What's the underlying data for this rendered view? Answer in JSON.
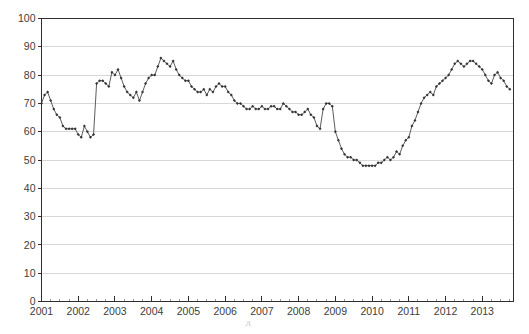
{
  "chart_data": {
    "type": "line",
    "title": "",
    "xlabel": "",
    "ylabel": "",
    "ylim": [
      0,
      100
    ],
    "xlim": [
      2001.0,
      2013.85
    ],
    "grid": "horizontal",
    "legend": "none",
    "y_ticks": [
      0,
      10,
      20,
      30,
      40,
      50,
      60,
      70,
      80,
      90,
      100
    ],
    "x_ticks": [
      2001,
      2002,
      2003,
      2004,
      2005,
      2006,
      2007,
      2008,
      2009,
      2010,
      2011,
      2012,
      2013
    ],
    "marker": "diamond",
    "series": [
      {
        "name": "index",
        "x": [
          2001.0,
          2001.083,
          2001.167,
          2001.25,
          2001.333,
          2001.417,
          2001.5,
          2001.583,
          2001.667,
          2001.75,
          2001.833,
          2001.917,
          2002.0,
          2002.083,
          2002.167,
          2002.25,
          2002.333,
          2002.417,
          2002.5,
          2002.583,
          2002.667,
          2002.75,
          2002.833,
          2002.917,
          2003.0,
          2003.083,
          2003.167,
          2003.25,
          2003.333,
          2003.417,
          2003.5,
          2003.583,
          2003.667,
          2003.75,
          2003.833,
          2003.917,
          2004.0,
          2004.083,
          2004.167,
          2004.25,
          2004.333,
          2004.417,
          2004.5,
          2004.583,
          2004.667,
          2004.75,
          2004.833,
          2004.917,
          2005.0,
          2005.083,
          2005.167,
          2005.25,
          2005.333,
          2005.417,
          2005.5,
          2005.583,
          2005.667,
          2005.75,
          2005.833,
          2005.917,
          2006.0,
          2006.083,
          2006.167,
          2006.25,
          2006.333,
          2006.417,
          2006.5,
          2006.583,
          2006.667,
          2006.75,
          2006.833,
          2006.917,
          2007.0,
          2007.083,
          2007.167,
          2007.25,
          2007.333,
          2007.417,
          2007.5,
          2007.583,
          2007.667,
          2007.75,
          2007.833,
          2007.917,
          2008.0,
          2008.083,
          2008.167,
          2008.25,
          2008.333,
          2008.417,
          2008.5,
          2008.583,
          2008.667,
          2008.75,
          2008.833,
          2008.917,
          2009.0,
          2009.083,
          2009.167,
          2009.25,
          2009.333,
          2009.417,
          2009.5,
          2009.583,
          2009.667,
          2009.75,
          2009.833,
          2009.917,
          2010.0,
          2010.083,
          2010.167,
          2010.25,
          2010.333,
          2010.417,
          2010.5,
          2010.583,
          2010.667,
          2010.75,
          2010.833,
          2010.917,
          2011.0,
          2011.083,
          2011.167,
          2011.25,
          2011.333,
          2011.417,
          2011.5,
          2011.583,
          2011.667,
          2011.75,
          2011.833,
          2011.917,
          2012.0,
          2012.083,
          2012.167,
          2012.25,
          2012.333,
          2012.417,
          2012.5,
          2012.583,
          2012.667,
          2012.75,
          2012.833,
          2012.917,
          2013.0,
          2013.083,
          2013.167,
          2013.25,
          2013.333,
          2013.417,
          2013.5,
          2013.583,
          2013.667,
          2013.75
        ],
        "values": [
          70,
          73,
          74,
          71,
          68,
          66,
          65,
          62,
          61,
          61,
          61,
          61,
          59,
          58,
          62,
          60,
          58,
          59,
          77,
          78,
          78,
          77,
          76,
          81,
          80,
          82,
          79,
          76,
          74,
          73,
          72,
          74,
          71,
          74,
          77,
          79,
          80,
          80,
          83,
          86,
          85,
          84,
          83,
          85,
          82,
          80,
          79,
          78,
          78,
          76,
          75,
          74,
          74,
          75,
          73,
          75,
          74,
          76,
          77,
          76,
          76,
          74,
          73,
          71,
          70,
          70,
          69,
          68,
          68,
          69,
          68,
          68,
          69,
          68,
          68,
          69,
          69,
          68,
          68,
          70,
          69,
          68,
          67,
          67,
          66,
          66,
          67,
          68,
          66,
          65,
          62,
          61,
          68,
          70,
          70,
          69,
          60,
          57,
          54,
          52,
          51,
          51,
          50,
          50,
          49,
          48,
          48,
          48,
          48,
          48,
          49,
          49,
          50,
          51,
          50,
          51,
          53,
          52,
          55,
          57,
          58,
          62,
          64,
          67,
          70,
          72,
          73,
          74,
          73,
          76,
          77,
          78,
          79,
          80,
          82,
          84,
          85,
          84,
          83,
          84,
          85,
          85,
          84,
          83,
          82,
          80,
          78,
          77,
          80,
          81,
          79,
          78,
          76,
          75
        ]
      }
    ]
  },
  "axes": {
    "y_labels": [
      "100",
      "90",
      "80",
      "70",
      "60",
      "50",
      "40",
      "30",
      "20",
      "10",
      "0"
    ],
    "x_labels": [
      "2001",
      "2002",
      "2003",
      "2004",
      "2005",
      "2006",
      "2007",
      "2008",
      "2009",
      "2010",
      "2011",
      "2012",
      "2013"
    ]
  },
  "watermark": {
    "glyph": "д"
  },
  "colors": {
    "line": "#4a4a4a",
    "marker": "#333333",
    "grid": "#d8d8d8",
    "axis": "#2f2f2f",
    "text": "#3c3c3c",
    "background": "#ffffff"
  }
}
